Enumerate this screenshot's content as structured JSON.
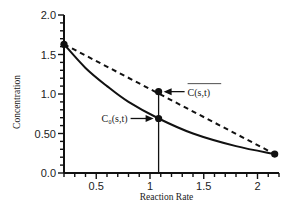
{
  "chart_data": {
    "type": "line",
    "title": "",
    "xlabel": "Reaction Rate",
    "ylabel": "Concentration",
    "xlim": [
      0.2,
      2.2
    ],
    "ylim": [
      0.0,
      2.0
    ],
    "x_ticks": [
      0.5,
      1,
      1.5,
      2
    ],
    "x_tick_labels": [
      "0.5",
      "1",
      "1.5",
      "2"
    ],
    "y_ticks": [
      0.0,
      0.5,
      1.0,
      1.5,
      2.0
    ],
    "y_tick_labels": [
      "0.0",
      "0.50",
      "1.0",
      "1.5",
      "2.0"
    ],
    "grid": false,
    "series": [
      {
        "name": "C0(s,t) curve",
        "style": "solid",
        "x": [
          0.2,
          0.4,
          0.6,
          0.8,
          1.08,
          1.4,
          1.8,
          2.16
        ],
        "values": [
          1.63,
          1.33,
          1.1,
          0.9,
          0.69,
          0.5,
          0.34,
          0.24
        ]
      },
      {
        "name": "C(s,t) average (chord)",
        "style": "dashed",
        "x": [
          0.2,
          2.16
        ],
        "values": [
          1.63,
          0.24
        ]
      }
    ],
    "points": [
      {
        "x": 0.2,
        "y": 1.63
      },
      {
        "x": 1.08,
        "y": 1.03
      },
      {
        "x": 1.08,
        "y": 0.69
      },
      {
        "x": 2.16,
        "y": 0.24
      }
    ],
    "vertical_line": {
      "x": 1.08,
      "y_from": 0.0,
      "y_to": 1.03
    },
    "annotations": [
      {
        "text": "C(s,t)",
        "overline": true,
        "target": {
          "x": 1.08,
          "y": 1.03
        },
        "side": "right"
      },
      {
        "text": "C₀(s,t)",
        "overline": false,
        "target": {
          "x": 1.08,
          "y": 0.69
        },
        "side": "left"
      }
    ]
  }
}
